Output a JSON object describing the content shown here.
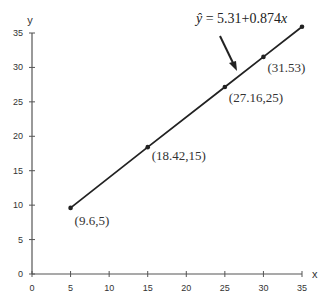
{
  "chart_data": {
    "type": "line",
    "title": "",
    "xlabel": "x",
    "ylabel": "y",
    "xlim": [
      0,
      35
    ],
    "ylim": [
      0,
      35
    ],
    "x_ticks": [
      "0",
      "5",
      "10",
      "15",
      "20",
      "25",
      "30",
      "35"
    ],
    "y_ticks": [
      "0",
      "5",
      "10",
      "15",
      "20",
      "25",
      "30",
      "35"
    ],
    "grid": false,
    "series": [
      {
        "name": "regression line",
        "x": [
          5,
          15,
          25,
          30,
          35
        ],
        "y": [
          9.6,
          18.42,
          27.16,
          31.53,
          35.9
        ]
      }
    ],
    "annotations": [
      {
        "text": "(9.6,5)",
        "x": 5,
        "y": 9.6
      },
      {
        "text": "(18.42,15)",
        "x": 15,
        "y": 18.42
      },
      {
        "text": "(27.16,25)",
        "x": 25,
        "y": 27.16
      },
      {
        "text": "(31.53)",
        "x": 30,
        "y": 31.53
      }
    ],
    "equation": {
      "hat": "ŷ",
      "rest": " = 5.31+0.874",
      "var": "x"
    },
    "color": "#222222"
  }
}
